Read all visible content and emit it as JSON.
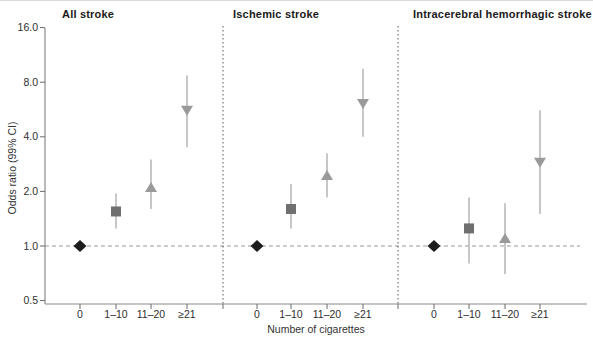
{
  "chart_data": {
    "type": "scatter",
    "subtype": "forest-plot-odds-ratios-with-error-bars",
    "ylabel": "Odds ratio (99% CI)",
    "xlabel": "Number of cigarettes",
    "yscale": "log2",
    "ylim": [
      0.5,
      16.0
    ],
    "ytick_labels": [
      "16.0",
      "8.0",
      "4.0",
      "2.0",
      "1.0",
      "0.5"
    ],
    "ytick_values": [
      16.0,
      8.0,
      4.0,
      2.0,
      1.0,
      0.5
    ],
    "reference_line_y": 1.0,
    "grid": "off",
    "legend": "none",
    "categories": [
      "0",
      "1–10",
      "11–20",
      "≥21"
    ],
    "marker_styles": [
      {
        "category": "0",
        "shape": "diamond",
        "color": "#1c1c1c",
        "name": "diamond-marker"
      },
      {
        "category": "1–10",
        "shape": "square",
        "color": "#6f6f6f",
        "name": "square-marker"
      },
      {
        "category": "11–20",
        "shape": "triangle-up",
        "color": "#9a9a9a",
        "name": "triangle-up-marker"
      },
      {
        "category": "≥21",
        "shape": "triangle-down",
        "color": "#9a9a9a",
        "name": "triangle-down-marker"
      }
    ],
    "colors": {
      "ci_line": "#b9b9b9",
      "axis": "#8a8a8a",
      "tick": "#6b6b6b",
      "text": "#2e2e2e",
      "separator_dash": "#555555",
      "reference_dash": "#999999"
    },
    "panels": [
      {
        "title": "All stroke",
        "points": [
          {
            "category": "0",
            "or": 1.0,
            "lo": null,
            "hi": null
          },
          {
            "category": "1–10",
            "or": 1.55,
            "lo": 1.25,
            "hi": 1.95
          },
          {
            "category": "11–20",
            "or": 2.1,
            "lo": 1.6,
            "hi": 3.0
          },
          {
            "category": "≥21",
            "or": 5.6,
            "lo": 3.5,
            "hi": 8.7
          }
        ]
      },
      {
        "title": "Ischemic stroke",
        "points": [
          {
            "category": "0",
            "or": 1.0,
            "lo": null,
            "hi": null
          },
          {
            "category": "1–10",
            "or": 1.6,
            "lo": 1.25,
            "hi": 2.2
          },
          {
            "category": "11–20",
            "or": 2.45,
            "lo": 1.85,
            "hi": 3.25
          },
          {
            "category": "≥21",
            "or": 6.1,
            "lo": 4.0,
            "hi": 9.5
          }
        ]
      },
      {
        "title": "Intracerebral hemorrhagic stroke",
        "points": [
          {
            "category": "0",
            "or": 1.0,
            "lo": null,
            "hi": null
          },
          {
            "category": "1–10",
            "or": 1.25,
            "lo": 0.8,
            "hi": 1.85
          },
          {
            "category": "11–20",
            "or": 1.1,
            "lo": 0.7,
            "hi": 1.72
          },
          {
            "category": "≥21",
            "or": 2.9,
            "lo": 1.5,
            "hi": 5.6
          }
        ]
      }
    ]
  }
}
